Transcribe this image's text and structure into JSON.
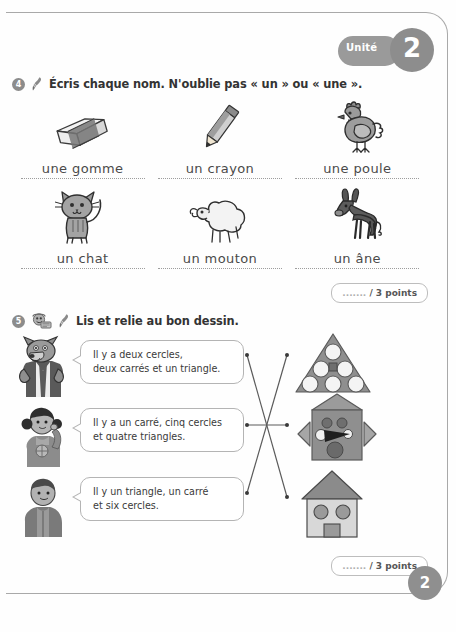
{
  "page": {
    "unit_label": "Unité",
    "unit_number": "2",
    "page_number": "2"
  },
  "exercise4": {
    "number": "4",
    "instruction": "Écris chaque nom. N'oublie pas « un » ou « une ».",
    "pen_icon": "pen-icon",
    "items": [
      {
        "picture": "eraser-icon",
        "answer": "une gomme"
      },
      {
        "picture": "pencil-icon",
        "answer": "un crayon"
      },
      {
        "picture": "hen-icon",
        "answer": "une poule"
      },
      {
        "picture": "cat-icon",
        "answer": "un chat"
      },
      {
        "picture": "sheep-icon",
        "answer": "un mouton"
      },
      {
        "picture": "donkey-icon",
        "answer": "un âne"
      }
    ],
    "points": {
      "blank": ".......",
      "label": "/ 3 points"
    }
  },
  "exercise5": {
    "number": "5",
    "instruction": "Lis et relie au bon dessin.",
    "listen_icon": "headphones-icon",
    "pen_icon": "pen-icon",
    "characters": [
      {
        "name": "wolf-character"
      },
      {
        "name": "girl-character"
      },
      {
        "name": "boy-character"
      }
    ],
    "bubbles": [
      {
        "line1": "Il y a deux cercles,",
        "line2": "deux carrés et un triangle."
      },
      {
        "line1": "Il y a un carré, cinq cercles",
        "line2": "et quatre triangles."
      },
      {
        "line1": "Il y un triangle, un carré",
        "line2": "et six cercles."
      }
    ],
    "drawings": [
      {
        "name": "triangle-with-circles-drawing"
      },
      {
        "name": "robot-house-drawing"
      },
      {
        "name": "house-drawing"
      }
    ],
    "matches": [
      {
        "from": 0,
        "to": 2
      },
      {
        "from": 1,
        "to": 1
      },
      {
        "from": 2,
        "to": 0
      }
    ],
    "points": {
      "blank": ".......",
      "label": "/ 3 points"
    }
  },
  "colors": {
    "ink": "#3b3b3b",
    "badge_gray": "#8d8d8d",
    "line_gray": "#a9a9a9",
    "shape_fill": "#9a9a9a"
  }
}
